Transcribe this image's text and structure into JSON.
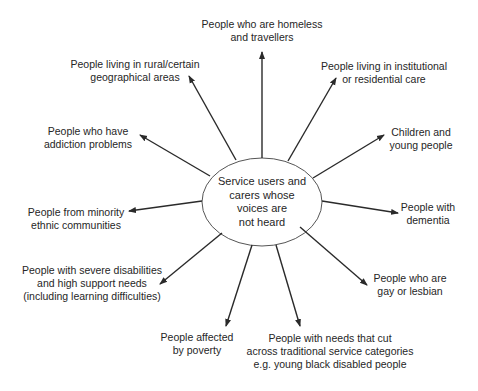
{
  "diagram": {
    "type": "hub-and-spoke",
    "center": {
      "lines": [
        "Service users and",
        "carers whose",
        "voices are",
        "not heard"
      ]
    },
    "nodes": [
      {
        "id": "homeless",
        "lines": [
          "People who are homeless",
          "and travellers"
        ]
      },
      {
        "id": "institutional",
        "lines": [
          "People living in institutional",
          "or residential care"
        ]
      },
      {
        "id": "children",
        "lines": [
          "Children and",
          "young people"
        ]
      },
      {
        "id": "dementia",
        "lines": [
          "People with",
          "dementia"
        ]
      },
      {
        "id": "gay",
        "lines": [
          "People who are",
          "gay or lesbian"
        ]
      },
      {
        "id": "cross-cutting",
        "lines": [
          "People with needs that cut",
          "across traditional service categories",
          "e.g. young black disabled people"
        ]
      },
      {
        "id": "poverty",
        "lines": [
          "People affected",
          "by poverty"
        ]
      },
      {
        "id": "disabilities",
        "lines": [
          "People with severe disabilities",
          "and high support needs",
          "(including learning difficulties)"
        ]
      },
      {
        "id": "minority",
        "lines": [
          "People from minority",
          "ethnic communities"
        ]
      },
      {
        "id": "addiction",
        "lines": [
          "People who have",
          "addiction problems"
        ]
      },
      {
        "id": "rural",
        "lines": [
          "People living in rural/certain",
          "geographical areas"
        ]
      }
    ],
    "colors": {
      "line": "#2a2a2a",
      "ellipse_stroke": "#555555",
      "text": "#262626",
      "background": "#ffffff"
    }
  }
}
